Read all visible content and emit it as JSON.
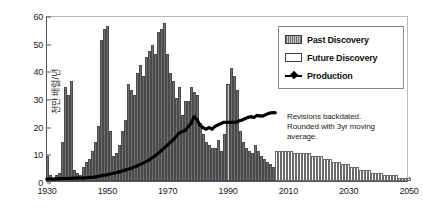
{
  "chart_data": {
    "type": "bar",
    "title": "",
    "xlabel": "",
    "ylabel": "천만 배럴/년",
    "xlim": [
      1930,
      2050
    ],
    "ylim": [
      0,
      60
    ],
    "grid": false,
    "legend_position": "upper-right",
    "xticks": [
      1930,
      1950,
      1970,
      1990,
      2010,
      2030,
      2050
    ],
    "yticks": [
      0,
      10,
      20,
      30,
      40,
      50,
      60
    ],
    "annotations": [
      "Revisions backdated.",
      "Rounded with 3yr moving",
      "average."
    ],
    "series": [
      {
        "name": "Past Discovery",
        "type": "bar",
        "color": "#6f6f6f",
        "x": [
          1930,
          1931,
          1932,
          1933,
          1934,
          1935,
          1936,
          1937,
          1938,
          1939,
          1940,
          1941,
          1942,
          1943,
          1944,
          1945,
          1946,
          1947,
          1948,
          1949,
          1950,
          1951,
          1952,
          1953,
          1954,
          1955,
          1956,
          1957,
          1958,
          1959,
          1960,
          1961,
          1962,
          1963,
          1964,
          1965,
          1966,
          1967,
          1968,
          1969,
          1970,
          1971,
          1972,
          1973,
          1974,
          1975,
          1976,
          1977,
          1978,
          1979,
          1980,
          1981,
          1982,
          1983,
          1984,
          1985,
          1986,
          1987,
          1988,
          1989,
          1990,
          1991,
          1992,
          1993,
          1994,
          1995,
          1996,
          1997,
          1998,
          1999,
          2000,
          2001,
          2002,
          2003,
          2004,
          2005
        ],
        "values": [
          9,
          2,
          1,
          2,
          3,
          14,
          34,
          31,
          36,
          4,
          3,
          2,
          5,
          7,
          8,
          11,
          14,
          20,
          51,
          55,
          56,
          18,
          9,
          10,
          13,
          18,
          22,
          35,
          33,
          31,
          39,
          42,
          38,
          45,
          47,
          49,
          46,
          54,
          55,
          57,
          46,
          39,
          36,
          30,
          34,
          24,
          29,
          29,
          34,
          32,
          31,
          21,
          17,
          14,
          13,
          12,
          12,
          15,
          11,
          17,
          35,
          41,
          38,
          33,
          18,
          14,
          12,
          11,
          10,
          13,
          11,
          9,
          8,
          7,
          6,
          5
        ]
      },
      {
        "name": "Future Discovery",
        "type": "bar",
        "color": "#ffffff",
        "x": [
          2006,
          2007,
          2008,
          2009,
          2010,
          2011,
          2012,
          2013,
          2014,
          2015,
          2016,
          2017,
          2018,
          2019,
          2020,
          2021,
          2022,
          2023,
          2024,
          2025,
          2026,
          2027,
          2028,
          2029,
          2030,
          2031,
          2032,
          2033,
          2034,
          2035,
          2036,
          2037,
          2038,
          2039,
          2040,
          2041,
          2042,
          2043,
          2044,
          2045,
          2046,
          2047,
          2048,
          2049,
          2050
        ],
        "values": [
          11,
          11,
          11,
          11,
          11,
          11,
          10,
          10,
          10,
          10,
          10,
          10,
          9,
          9,
          9,
          9,
          8,
          8,
          8,
          7,
          7,
          7,
          6,
          6,
          6,
          5,
          5,
          5,
          4,
          4,
          4,
          4,
          3,
          3,
          3,
          3,
          2,
          2,
          2,
          2,
          2,
          1,
          1,
          1,
          1
        ]
      },
      {
        "name": "Production",
        "type": "line",
        "color": "#000000",
        "x": [
          1930,
          1932,
          1934,
          1936,
          1938,
          1940,
          1942,
          1944,
          1946,
          1948,
          1950,
          1952,
          1954,
          1956,
          1958,
          1960,
          1962,
          1964,
          1966,
          1968,
          1970,
          1972,
          1974,
          1976,
          1978,
          1979,
          1980,
          1981,
          1982,
          1983,
          1984,
          1985,
          1986,
          1987,
          1988,
          1989,
          1990,
          1991,
          1992,
          1993,
          1994,
          1995,
          1996,
          1997,
          1998,
          1999,
          2000,
          2001,
          2002,
          2003,
          2004,
          2005,
          2006
        ],
        "values": [
          0.7,
          0.7,
          0.8,
          0.9,
          1.0,
          1.1,
          1.1,
          1.3,
          1.5,
          1.9,
          2.3,
          2.8,
          3.3,
          4.0,
          4.6,
          5.5,
          6.5,
          7.7,
          9.2,
          11.0,
          13.0,
          15.0,
          17.5,
          18.5,
          21.0,
          23.5,
          22.5,
          20.5,
          19.5,
          19.0,
          19.5,
          19.0,
          20.0,
          20.5,
          21.0,
          21.5,
          21.5,
          21.5,
          21.5,
          21.5,
          22.0,
          22.3,
          22.8,
          23.3,
          23.5,
          23.3,
          24.0,
          23.8,
          23.8,
          24.3,
          24.8,
          25.0,
          25.0
        ]
      }
    ]
  },
  "legend": {
    "items": [
      {
        "label": "Past Discovery",
        "swatch": "past"
      },
      {
        "label": "Future Discovery",
        "swatch": "future"
      },
      {
        "label": "Production",
        "swatch": "prod"
      }
    ]
  }
}
